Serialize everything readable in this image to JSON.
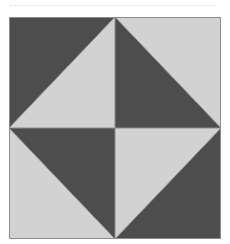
{
  "figure": {
    "name": "quilt-block-diagram",
    "title": "",
    "caption": "",
    "background_color": "#ffffff"
  },
  "rule": {
    "name": "dotted-separator",
    "style": "dotted",
    "color": "#d8d8d8",
    "x": 10,
    "y": 5,
    "width": 206,
    "thickness": 1
  },
  "block": {
    "x": 9,
    "y": 17,
    "width": 212,
    "height": 222,
    "border_color": "#8c8c8c",
    "border_width": 1,
    "divider_color": "#8c8c8c",
    "divider_width": 1,
    "center_x": 106,
    "center_y": 111
  },
  "palette": {
    "dark": "#4d4d4d",
    "light": "#d2d2d2",
    "outline": "#8c8c8c",
    "background": "#ffffff"
  },
  "quadrants": [
    {
      "name": "top-left",
      "diagonal": "from top-right corner to bottom-left corner",
      "triangles": [
        {
          "position": "upper-left",
          "fill": "#4d4d4d",
          "tone": "dark"
        },
        {
          "position": "lower-right",
          "fill": "#d2d2d2",
          "tone": "light"
        }
      ]
    },
    {
      "name": "top-right",
      "diagonal": "from top-left corner to bottom-right corner",
      "triangles": [
        {
          "position": "lower-left",
          "fill": "#4d4d4d",
          "tone": "dark"
        },
        {
          "position": "upper-right",
          "fill": "#d2d2d2",
          "tone": "light"
        }
      ]
    },
    {
      "name": "bottom-left",
      "diagonal": "from top-left corner to bottom-right corner",
      "triangles": [
        {
          "position": "upper-right",
          "fill": "#4d4d4d",
          "tone": "dark"
        },
        {
          "position": "lower-left",
          "fill": "#d2d2d2",
          "tone": "light"
        }
      ]
    },
    {
      "name": "bottom-right",
      "diagonal": "from top-right corner to bottom-left corner",
      "triangles": [
        {
          "position": "lower-right",
          "fill": "#4d4d4d",
          "tone": "dark"
        },
        {
          "position": "upper-left",
          "fill": "#d2d2d2",
          "tone": "light"
        }
      ]
    }
  ],
  "pattern": {
    "description": "Four half-square triangle units forming a light diamond on a dark ground",
    "dark_shapes": "four corner triangles",
    "light_shapes": "central diamond of four triangles"
  }
}
